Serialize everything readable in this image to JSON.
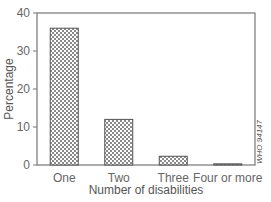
{
  "chart_data": {
    "type": "bar",
    "title": "",
    "xlabel": "Number of disabilities",
    "ylabel": "Percentage",
    "categories": [
      "One",
      "Two",
      "Three",
      "Four or more"
    ],
    "values": [
      36,
      12,
      2.3,
      0.3
    ],
    "ylim": [
      0,
      40
    ],
    "yticks": [
      0,
      10,
      20,
      30,
      40
    ],
    "grid": false,
    "legend": null,
    "bar_fill": "crosshatch",
    "annotations": [
      "WHO 94147"
    ]
  },
  "colors": {
    "axis": "#777777",
    "bar_edge": "#555555",
    "hatch": "#888888"
  }
}
